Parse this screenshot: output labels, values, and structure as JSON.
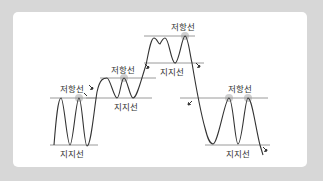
{
  "diagram": {
    "title": "",
    "type": "support-resistance-trend-diagram",
    "colors": {
      "background": "#d7d7d7",
      "card": "#ffffff",
      "line": "#333333",
      "level_line": "#9a9a9a",
      "highlight": "#c8c8c8",
      "arrow": "#333333"
    },
    "stages": [
      {
        "id": "stage-1",
        "resistance_label": "저항선",
        "support_label": "지지선"
      },
      {
        "id": "stage-2",
        "resistance_label": "저항선",
        "support_label": "지지선"
      },
      {
        "id": "stage-3",
        "resistance_label": "저항선",
        "support_label": "지지선"
      },
      {
        "id": "stage-4",
        "resistance_label": "저항선",
        "support_label": "지지선"
      }
    ]
  }
}
